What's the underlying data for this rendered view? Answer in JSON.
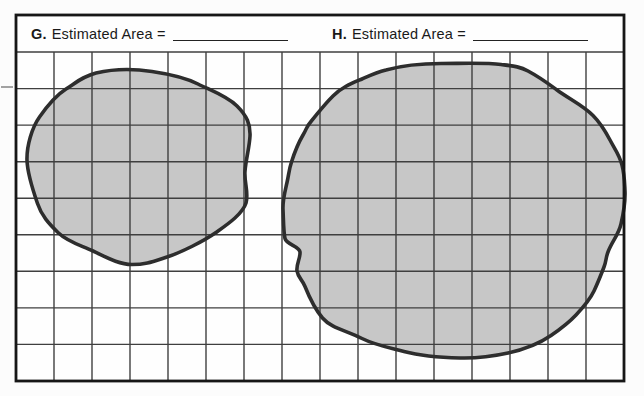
{
  "document": {
    "type": "worksheet-grid-area-estimation",
    "panels": [
      {
        "label": "G.",
        "caption": "Estimated Area =",
        "answer_blank": ""
      },
      {
        "label": "H.",
        "caption": "Estimated Area =",
        "answer_blank": ""
      }
    ]
  },
  "figure": {
    "grid": {
      "x": 16,
      "y": 52,
      "width": 608,
      "height": 329,
      "columns": 16,
      "rows": 9
    },
    "colors": {
      "page_bg": "#fcfcfc",
      "paper": "#fefefe",
      "grid_line": "#3f3f3f",
      "border": "#161616",
      "blob_fill": "#c7c7c7",
      "blob_outline": "#2d2d2d",
      "text": "#1a1a1a"
    },
    "blob_g": {
      "name": "irregular-region-G",
      "path": "M 96,73 C 115,68.5 136,69 152,71.5 C 169,74 186,78 198,84 C 211,90.5 227,96 237,106 C 247,116 250.5,124 250,136 C 249.5,147 246,159 245,171 C 244,182 249,193 246,203 C 242.5,214 228,224 216,232.5 C 203,241.5 182,252 167,257 C 153,261.5 146,264.5 132,264.5 C 118,264.5 105,256.5 93,251 C 80,245 68,242 58.5,233 C 48.5,223.5 41.5,215.5 37.5,203.5 C 33,190.5 27.5,174 27,160.5 C 26.5,146 32,127.5 39.5,117 C 47.5,105.5 55,96 66,89 C 77.5,81.5 84,76 96,73 Z"
    },
    "blob_h": {
      "name": "irregular-region-H",
      "path": "M 386,70 C 402,65.5 422,63.5 441,63.5 C 462,63.5 487,62.5 501,64.5 C 513,66 520,66.5 528,71 C 541,78 548,83.5 557,90 C 570,99.5 583,105.5 593,115.5 C 601,123.5 605,130.5 610,140 C 615,149.5 619.5,155 622,165 C 624.5,174.5 624.5,181.5 625,191 C 625.5,202.5 623.5,213 621,224 C 618.5,235 612,241.5 608,252 C 605.5,258.5 606.5,260.5 604,267 C 600.5,276 598,282.5 594,291 C 589.5,300.5 583.5,307 576,315 C 568.5,323 560.5,329 551,335.5 C 538,344.5 524,349.5 508,353 C 492,356.5 477,358.5 460,358 C 440,357.5 421,356 404,351.5 C 388.5,347.5 375,345 362,338.5 C 346.5,330.5 331,328 322.5,318 C 314.5,308.5 309,296.5 305,286.5 C 302.5,280 298,277.5 297,271 C 296,264.5 300.5,258.5 300,252 C 299.5,246.5 286.5,244.5 285,238.5 C 283.5,232 283.5,219.5 283,209.5 C 282.5,200 285,191.5 287,182.5 C 289,173.5 289,169.5 291.5,162 C 294.5,152.5 298,143.5 303,135 C 307.5,127.5 305.5,128 311,121.5 C 319,112 323,106 333,96 C 342,87 351.5,83.5 362,79 C 371,75 376,72.5 386,70 Z"
    }
  }
}
